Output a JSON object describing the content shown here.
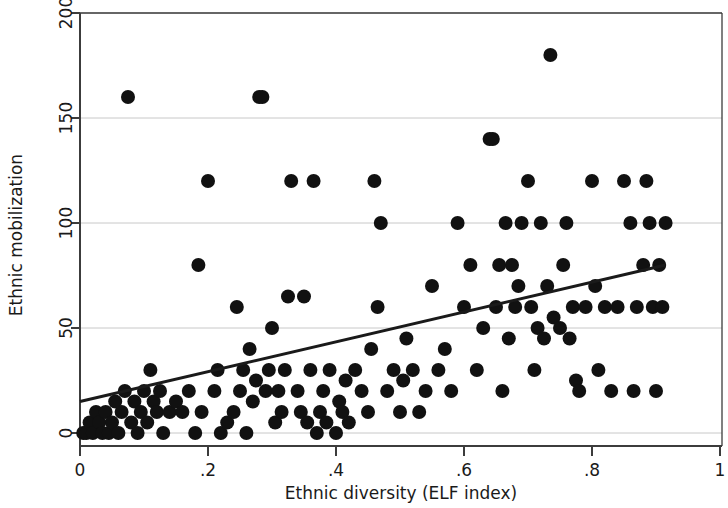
{
  "chart_data": {
    "type": "scatter",
    "title": "",
    "xlabel": "Ethnic diversity (ELF index)",
    "ylabel": "Ethnic mobilization",
    "xlim": [
      0,
      1
    ],
    "ylim": [
      0,
      200
    ],
    "xticks": [
      0,
      0.2,
      0.4,
      0.6,
      0.8,
      1
    ],
    "xticklabels": [
      "0",
      ".2",
      ".4",
      ".6",
      ".8",
      "1"
    ],
    "yticks": [
      0,
      50,
      100,
      150,
      200
    ],
    "yticklabels": [
      "0",
      "50",
      "100",
      "150",
      "200"
    ],
    "grid": "horizontal",
    "grid_color": "#c8c8c8",
    "marker_color": "#111111",
    "marker_size": 7,
    "legend": null,
    "series": [
      {
        "name": "Countries",
        "type": "scatter",
        "points": [
          [
            0.005,
            0
          ],
          [
            0.01,
            0
          ],
          [
            0.015,
            5
          ],
          [
            0.02,
            0
          ],
          [
            0.025,
            10
          ],
          [
            0.03,
            5
          ],
          [
            0.035,
            0
          ],
          [
            0.04,
            10
          ],
          [
            0.045,
            0
          ],
          [
            0.05,
            5
          ],
          [
            0.055,
            15
          ],
          [
            0.06,
            0
          ],
          [
            0.065,
            10
          ],
          [
            0.07,
            20
          ],
          [
            0.075,
            160
          ],
          [
            0.08,
            5
          ],
          [
            0.085,
            15
          ],
          [
            0.09,
            0
          ],
          [
            0.095,
            10
          ],
          [
            0.1,
            20
          ],
          [
            0.105,
            5
          ],
          [
            0.11,
            30
          ],
          [
            0.115,
            15
          ],
          [
            0.12,
            10
          ],
          [
            0.125,
            20
          ],
          [
            0.13,
            0
          ],
          [
            0.14,
            10
          ],
          [
            0.15,
            15
          ],
          [
            0.16,
            10
          ],
          [
            0.17,
            20
          ],
          [
            0.18,
            0
          ],
          [
            0.185,
            80
          ],
          [
            0.19,
            10
          ],
          [
            0.2,
            120
          ],
          [
            0.21,
            20
          ],
          [
            0.215,
            30
          ],
          [
            0.22,
            0
          ],
          [
            0.23,
            5
          ],
          [
            0.24,
            10
          ],
          [
            0.245,
            60
          ],
          [
            0.25,
            20
          ],
          [
            0.255,
            30
          ],
          [
            0.26,
            0
          ],
          [
            0.265,
            40
          ],
          [
            0.27,
            15
          ],
          [
            0.275,
            25
          ],
          [
            0.28,
            160
          ],
          [
            0.285,
            160
          ],
          [
            0.29,
            20
          ],
          [
            0.295,
            30
          ],
          [
            0.3,
            50
          ],
          [
            0.305,
            5
          ],
          [
            0.31,
            20
          ],
          [
            0.315,
            10
          ],
          [
            0.32,
            30
          ],
          [
            0.325,
            65
          ],
          [
            0.33,
            120
          ],
          [
            0.34,
            20
          ],
          [
            0.345,
            10
          ],
          [
            0.35,
            65
          ],
          [
            0.355,
            5
          ],
          [
            0.36,
            30
          ],
          [
            0.365,
            120
          ],
          [
            0.37,
            0
          ],
          [
            0.375,
            10
          ],
          [
            0.38,
            20
          ],
          [
            0.385,
            5
          ],
          [
            0.39,
            30
          ],
          [
            0.4,
            0
          ],
          [
            0.405,
            15
          ],
          [
            0.41,
            10
          ],
          [
            0.415,
            25
          ],
          [
            0.42,
            5
          ],
          [
            0.43,
            30
          ],
          [
            0.44,
            20
          ],
          [
            0.45,
            10
          ],
          [
            0.455,
            40
          ],
          [
            0.46,
            120
          ],
          [
            0.465,
            60
          ],
          [
            0.47,
            100
          ],
          [
            0.48,
            20
          ],
          [
            0.49,
            30
          ],
          [
            0.5,
            10
          ],
          [
            0.505,
            25
          ],
          [
            0.51,
            45
          ],
          [
            0.52,
            30
          ],
          [
            0.53,
            10
          ],
          [
            0.54,
            20
          ],
          [
            0.55,
            70
          ],
          [
            0.56,
            30
          ],
          [
            0.57,
            40
          ],
          [
            0.58,
            20
          ],
          [
            0.59,
            100
          ],
          [
            0.6,
            60
          ],
          [
            0.61,
            80
          ],
          [
            0.62,
            30
          ],
          [
            0.63,
            50
          ],
          [
            0.64,
            140
          ],
          [
            0.645,
            140
          ],
          [
            0.65,
            60
          ],
          [
            0.655,
            80
          ],
          [
            0.66,
            20
          ],
          [
            0.665,
            100
          ],
          [
            0.67,
            45
          ],
          [
            0.675,
            80
          ],
          [
            0.68,
            60
          ],
          [
            0.685,
            70
          ],
          [
            0.69,
            100
          ],
          [
            0.7,
            120
          ],
          [
            0.705,
            60
          ],
          [
            0.71,
            30
          ],
          [
            0.715,
            50
          ],
          [
            0.72,
            100
          ],
          [
            0.725,
            45
          ],
          [
            0.73,
            70
          ],
          [
            0.735,
            180
          ],
          [
            0.74,
            55
          ],
          [
            0.75,
            50
          ],
          [
            0.755,
            80
          ],
          [
            0.76,
            100
          ],
          [
            0.765,
            45
          ],
          [
            0.77,
            60
          ],
          [
            0.775,
            25
          ],
          [
            0.78,
            20
          ],
          [
            0.79,
            60
          ],
          [
            0.8,
            120
          ],
          [
            0.805,
            70
          ],
          [
            0.81,
            30
          ],
          [
            0.82,
            60
          ],
          [
            0.83,
            20
          ],
          [
            0.84,
            60
          ],
          [
            0.85,
            120
          ],
          [
            0.86,
            100
          ],
          [
            0.865,
            20
          ],
          [
            0.87,
            60
          ],
          [
            0.88,
            80
          ],
          [
            0.885,
            120
          ],
          [
            0.89,
            100
          ],
          [
            0.895,
            60
          ],
          [
            0.9,
            20
          ],
          [
            0.905,
            80
          ],
          [
            0.91,
            60
          ],
          [
            0.915,
            100
          ]
        ]
      },
      {
        "name": "Fitted regression line",
        "type": "line",
        "x": [
          0.0,
          0.915
        ],
        "y": [
          15,
          80
        ],
        "color": "#1a1a1a",
        "width": 3
      }
    ]
  },
  "figure": {
    "background": "#ffffff",
    "frame_color": "#3c3c3c"
  }
}
